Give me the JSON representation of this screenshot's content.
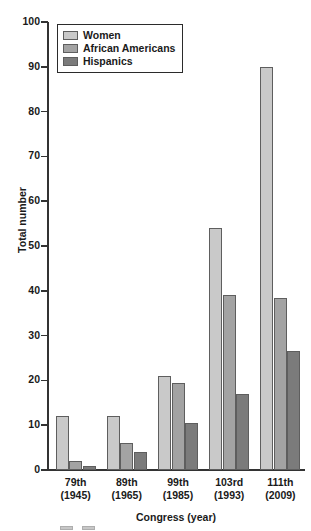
{
  "chart_data": {
    "type": "bar",
    "title": "",
    "xlabel": "Congress (year)",
    "ylabel": "Total number",
    "categories": [
      "79th\n(1945)",
      "89th\n(1965)",
      "99th\n(1985)",
      "103rd\n(1993)",
      "111th\n(2009)"
    ],
    "category_lines": [
      {
        "congress": "79th",
        "year": "(1945)"
      },
      {
        "congress": "89th",
        "year": "(1965)"
      },
      {
        "congress": "99th",
        "year": "(1985)"
      },
      {
        "congress": "103rd",
        "year": "(1993)"
      },
      {
        "congress": "111th",
        "year": "(2009)"
      }
    ],
    "series": [
      {
        "name": "Women",
        "color": "#c9c9c9",
        "values": [
          12,
          12,
          21,
          54,
          90
        ]
      },
      {
        "name": "African Americans",
        "color": "#a3a3a3",
        "values": [
          2,
          6,
          19.5,
          39,
          38.5
        ]
      },
      {
        "name": "Hispanics",
        "color": "#7b7b7b",
        "values": [
          1,
          4,
          10.5,
          17,
          26.5
        ]
      }
    ],
    "ylim": [
      0,
      100
    ],
    "yticks": [
      0,
      10,
      20,
      30,
      40,
      50,
      60,
      70,
      80,
      90,
      100
    ],
    "ytick_labels": [
      "0",
      "10",
      "20",
      "30",
      "40",
      "50",
      "60",
      "70",
      "80",
      "90",
      "100"
    ],
    "grid": false,
    "legend_position": "top-left"
  },
  "legend": {
    "entries": [
      {
        "label": "Women",
        "color": "#c9c9c9"
      },
      {
        "label": "African Americans",
        "color": "#a3a3a3"
      },
      {
        "label": "Hispanics",
        "color": "#7b7b7b"
      }
    ]
  },
  "colors": {
    "axis": "#333333",
    "text": "#1a1a1a",
    "background": "#ffffff",
    "bar_stroke": "#5e5e5e"
  }
}
